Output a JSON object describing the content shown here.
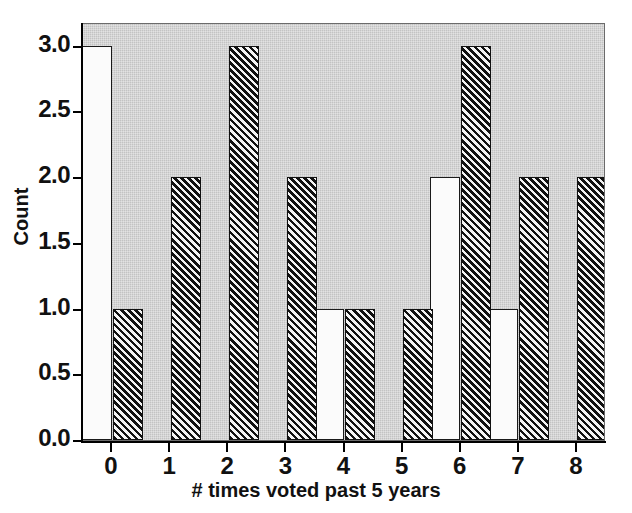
{
  "chart_data": {
    "type": "bar",
    "title": "",
    "xlabel": "# times voted past 5 years",
    "ylabel": "Count",
    "categories": [
      "0",
      "1",
      "2",
      "3",
      "4",
      "5",
      "6",
      "7",
      "8"
    ],
    "series": [
      {
        "name": "open",
        "style": "white-filled",
        "values": [
          3,
          0,
          0,
          0,
          1,
          0,
          2,
          1,
          0
        ]
      },
      {
        "name": "hatched",
        "style": "black-diagonal-hatch",
        "values": [
          1,
          2,
          3,
          2,
          1,
          1,
          3,
          2,
          2
        ]
      }
    ],
    "ylim": [
      0.0,
      3.18
    ],
    "ytick_values": [
      0.0,
      0.5,
      1.0,
      1.5,
      2.0,
      2.5,
      3.0
    ],
    "ytick_labels": [
      "0.0",
      "0.5",
      "1.0",
      "1.5",
      "2.0",
      "2.5",
      "3.0"
    ],
    "xtick_labels": [
      "0",
      "1",
      "2",
      "3",
      "4",
      "5",
      "6",
      "7",
      "8"
    ],
    "grid": false,
    "legend": null,
    "plot_background_color": "#c3c3c3",
    "figure_background_color": "#ffffff",
    "bar_outline_color": "#111111",
    "open_bar_fill_color": "#fbfbfb",
    "hatch_bar_color": "#111111"
  }
}
